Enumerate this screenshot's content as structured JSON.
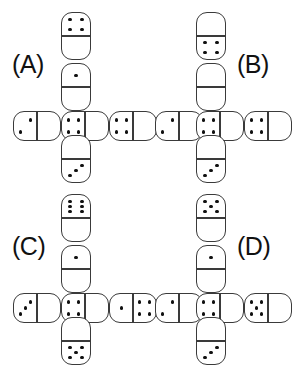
{
  "colors": {
    "background": "#ffffff",
    "outline": "#3a3a3a",
    "pip": "#101010",
    "label_text": "#111111"
  },
  "pip_layouts": {
    "0": [],
    "1": [
      "p-mc"
    ],
    "2": [
      "p-tr",
      "p-bl"
    ],
    "3": [
      "p-tr",
      "p-mc",
      "p-bl"
    ],
    "4": [
      "p-tl",
      "p-tr",
      "p-bl",
      "p-br"
    ],
    "5": [
      "p-tl",
      "p-tr",
      "p-mc",
      "p-bl",
      "p-br"
    ],
    "6": [
      "p-tl",
      "p-tr",
      "p-ml",
      "p-mr",
      "p-bl",
      "p-br"
    ]
  },
  "panels": [
    {
      "id": "A",
      "label": "(A)",
      "label_pos": {
        "x": 12,
        "y": 52
      },
      "dominoes": [
        {
          "name": "top",
          "orient": "v",
          "x": 61,
          "y": 12,
          "a": 4,
          "b": 0
        },
        {
          "name": "upper-middle",
          "orient": "v",
          "x": 61,
          "y": 63,
          "a": 1,
          "b": 0
        },
        {
          "name": "left",
          "orient": "h",
          "x": 13,
          "y": 111,
          "a": 2,
          "b": 0
        },
        {
          "name": "center",
          "orient": "h",
          "x": 61,
          "y": 111,
          "a": 4,
          "b": 0
        },
        {
          "name": "right",
          "orient": "h",
          "x": 109,
          "y": 111,
          "a": 4,
          "b": 0
        },
        {
          "name": "bottom",
          "orient": "v",
          "x": 61,
          "y": 135,
          "a": 0,
          "b": 3
        }
      ]
    },
    {
      "id": "B",
      "label": "(B)",
      "label_pos": {
        "x": 86,
        "y": 52
      },
      "dominoes": [
        {
          "name": "top",
          "orient": "v",
          "x": 45,
          "y": 12,
          "a": 0,
          "b": 4
        },
        {
          "name": "upper-middle",
          "orient": "v",
          "x": 45,
          "y": 63,
          "a": 0,
          "b": 0
        },
        {
          "name": "left",
          "orient": "h",
          "x": 4,
          "y": 111,
          "a": 2,
          "b": 0
        },
        {
          "name": "center",
          "orient": "h",
          "x": 45,
          "y": 111,
          "a": 4,
          "b": 0
        },
        {
          "name": "right",
          "orient": "h",
          "x": 93,
          "y": 111,
          "a": 4,
          "b": 0
        },
        {
          "name": "bottom",
          "orient": "v",
          "x": 45,
          "y": 135,
          "a": 0,
          "b": 3
        }
      ]
    },
    {
      "id": "C",
      "label": "(C)",
      "label_pos": {
        "x": 12,
        "y": 51
      },
      "dominoes": [
        {
          "name": "top",
          "orient": "v",
          "x": 61,
          "y": 11,
          "a": 6,
          "b": 0
        },
        {
          "name": "upper-middle",
          "orient": "v",
          "x": 61,
          "y": 62,
          "a": 1,
          "b": 0
        },
        {
          "name": "left",
          "orient": "h",
          "x": 13,
          "y": 110,
          "a": 3,
          "b": 0
        },
        {
          "name": "center",
          "orient": "h",
          "x": 61,
          "y": 110,
          "a": 4,
          "b": 0
        },
        {
          "name": "right",
          "orient": "h",
          "x": 109,
          "y": 110,
          "a": 1,
          "b": 4
        },
        {
          "name": "bottom",
          "orient": "v",
          "x": 61,
          "y": 134,
          "a": 0,
          "b": 5
        }
      ]
    },
    {
      "id": "D",
      "label": "(D)",
      "label_pos": {
        "x": 86,
        "y": 51
      },
      "dominoes": [
        {
          "name": "top",
          "orient": "v",
          "x": 45,
          "y": 11,
          "a": 5,
          "b": 0
        },
        {
          "name": "upper-middle",
          "orient": "v",
          "x": 45,
          "y": 62,
          "a": 1,
          "b": 0
        },
        {
          "name": "left",
          "orient": "h",
          "x": 4,
          "y": 110,
          "a": 2,
          "b": 0
        },
        {
          "name": "center",
          "orient": "h",
          "x": 45,
          "y": 110,
          "a": 4,
          "b": 0
        },
        {
          "name": "right",
          "orient": "h",
          "x": 93,
          "y": 110,
          "a": 5,
          "b": 0
        },
        {
          "name": "bottom",
          "orient": "v",
          "x": 45,
          "y": 134,
          "a": 0,
          "b": 3
        }
      ]
    }
  ]
}
